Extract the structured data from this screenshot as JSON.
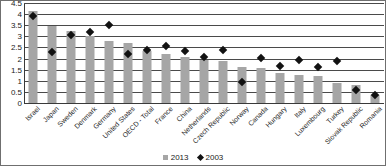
{
  "chart_data": {
    "type": "bar",
    "title": "",
    "subtitle": "",
    "xlabel": "",
    "ylabel": "",
    "ylim": [
      0,
      4.5
    ],
    "grid": true,
    "legend_position": "bottom",
    "categories": [
      "Israel",
      "Japan",
      "Sweden",
      "Denmark",
      "Germany",
      "United States",
      "OECD - Total",
      "France",
      "China",
      "Netherlands",
      "Czech Republic",
      "Norway",
      "Canada",
      "Hungary",
      "Italy",
      "Luxembourg",
      "Turkey",
      "Slovak Republic",
      "Romania"
    ],
    "ytick_labels": [
      "0",
      "0.5",
      "1",
      "1.5",
      "2",
      "2.5",
      "3",
      "3.5",
      "4",
      "4.5"
    ],
    "ytick_values": [
      0,
      0.5,
      1,
      1.5,
      2,
      2.5,
      3,
      3.5,
      4,
      4.5
    ],
    "series": [
      {
        "name": "2013",
        "marker": "square",
        "color": "#a6a6a6",
        "values": [
          4.2,
          3.5,
          3.3,
          3.05,
          2.85,
          2.75,
          2.4,
          2.25,
          2.1,
          2.0,
          1.95,
          1.65,
          1.6,
          1.4,
          1.3,
          1.25,
          0.95,
          0.85,
          0.4
        ]
      },
      {
        "name": "2003",
        "marker": "diamond",
        "color": "#121212",
        "values": [
          3.95,
          2.35,
          3.1,
          3.25,
          3.55,
          2.25,
          2.45,
          2.6,
          2.4,
          2.1,
          2.45,
          1.0,
          2.05,
          1.7,
          2.0,
          1.65,
          1.95,
          0.65,
          0.4
        ]
      }
    ]
  },
  "legend": {
    "items": [
      {
        "label": "2013",
        "marker": "square"
      },
      {
        "label": "2003",
        "marker": "diamond"
      }
    ]
  }
}
